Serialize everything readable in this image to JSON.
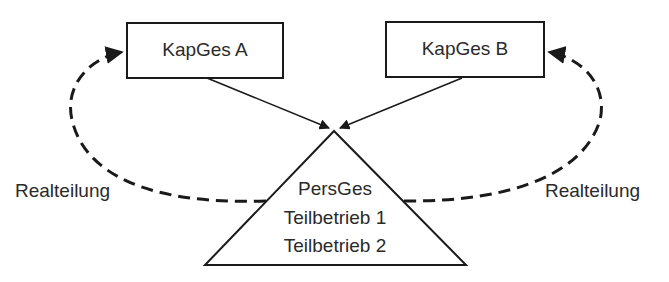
{
  "nodes": {
    "kapges_a": {
      "label": "KapGes A"
    },
    "kapges_b": {
      "label": "KapGes B"
    },
    "persges": {
      "lines": [
        "PersGes",
        "Teilbetrieb 1",
        "Teilbetrieb 2"
      ]
    }
  },
  "edges": {
    "left_label": "Realteilung",
    "right_label": "Realteilung"
  },
  "colors": {
    "stroke": "#1a1a1a",
    "background": "#ffffff"
  }
}
